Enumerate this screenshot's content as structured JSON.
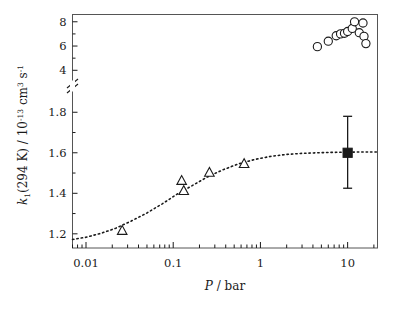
{
  "figure": {
    "background": "#ffffff",
    "frame_color": "#555555",
    "marker_color": "#1a1a1a"
  },
  "axes": {
    "x": {
      "label_main": "P",
      "label_rest": " / bar",
      "scale": "log",
      "range": [
        0.007,
        22
      ],
      "tick_labels": [
        "0.01",
        "0.1",
        "1",
        "10"
      ],
      "tick_values": [
        0.01,
        0.1,
        1,
        10
      ]
    },
    "y": {
      "label_parts": {
        "k": "k",
        "k_sub": "1",
        "temp": "(294 K)  /  10",
        "exp1": "-13",
        "unit1": " cm",
        "exp2": "3",
        "unit2": " s",
        "exp3": "-1"
      },
      "broken_axis": true,
      "lower_range": [
        1.13,
        1.9
      ],
      "lower_tick_labels": [
        "1.2",
        "1.4",
        "1.6",
        "1.8"
      ],
      "lower_tick_values": [
        1.2,
        1.4,
        1.6,
        1.8
      ],
      "upper_range": [
        3.2,
        8.6
      ],
      "upper_tick_labels": [
        "4",
        "6",
        "8"
      ],
      "upper_tick_values": [
        4,
        6,
        8
      ]
    }
  },
  "chart_data": {
    "type": "scatter",
    "title": "",
    "xlabel": "P / bar",
    "ylabel": "k1(294 K) / 10^-13 cm^3 s^-1",
    "xscale": "log",
    "xlim": [
      0.007,
      22
    ],
    "ylim_lower": [
      1.13,
      1.9
    ],
    "ylim_upper": [
      3.2,
      8.6
    ],
    "grid": false,
    "legend": "none",
    "series": [
      {
        "name": "open-triangles-low-pressure",
        "marker": "open-triangle-up",
        "x": [
          0.026,
          0.125,
          0.132,
          0.26,
          0.65
        ],
        "y": [
          1.215,
          1.462,
          1.412,
          1.502,
          1.545
        ]
      },
      {
        "name": "open-circles-high-pressure",
        "marker": "open-circle",
        "x": [
          4.5,
          6.0,
          7.4,
          8.3,
          9.2,
          10.0,
          11.3,
          12.0,
          13.6,
          15.0,
          15.4,
          16.2
        ],
        "y": [
          5.95,
          6.4,
          6.85,
          7.0,
          7.05,
          7.2,
          7.45,
          8.0,
          7.1,
          7.9,
          6.8,
          6.2
        ]
      },
      {
        "name": "filled-square-recommended-value",
        "marker": "filled-square",
        "x": [
          10.0
        ],
        "y": [
          1.6
        ],
        "yerr_low": [
          1.425
        ],
        "yerr_high": [
          1.78
        ]
      }
    ],
    "fit_curve": {
      "name": "dotted-falloff-fit",
      "style": "dotted",
      "x": [
        0.007,
        0.01,
        0.015,
        0.022,
        0.033,
        0.05,
        0.075,
        0.11,
        0.17,
        0.25,
        0.38,
        0.57,
        0.86,
        1.3,
        2.0,
        3.0,
        4.5,
        6.8,
        10.0,
        15.0,
        22.0
      ],
      "y": [
        1.172,
        1.183,
        1.203,
        1.228,
        1.263,
        1.303,
        1.348,
        1.395,
        1.441,
        1.482,
        1.518,
        1.546,
        1.567,
        1.582,
        1.592,
        1.597,
        1.6,
        1.602,
        1.603,
        1.604,
        1.604
      ]
    }
  }
}
